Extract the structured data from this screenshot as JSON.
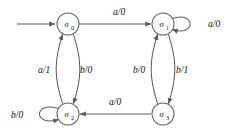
{
  "diagram": {
    "type": "finite-state-machine",
    "stroke_color": "#5e5e5e",
    "label_color": "#111111",
    "background": "#ffffff",
    "states": [
      {
        "id": "s0",
        "label": "σ",
        "subscript": "0",
        "cx": 68,
        "cy": 24,
        "r": 11,
        "initial": true
      },
      {
        "id": "s1",
        "label": "σ",
        "subscript": "1",
        "cx": 163,
        "cy": 24,
        "r": 11,
        "initial": false
      },
      {
        "id": "s2",
        "label": "σ",
        "subscript": "2",
        "cx": 68,
        "cy": 114,
        "r": 11,
        "initial": false
      },
      {
        "id": "s3",
        "label": "σ",
        "subscript": "3",
        "cx": 163,
        "cy": 114,
        "r": 11,
        "initial": false
      }
    ],
    "transitions": [
      {
        "from": "s0",
        "to": "s1",
        "input": "a",
        "output": "0",
        "label": "a/0",
        "label_x": 113,
        "label_y": 15
      },
      {
        "from": "s1",
        "to": "s1",
        "input": "a",
        "output": "0",
        "label": "a/0",
        "label_x": 208,
        "label_y": 27,
        "self_loop": true
      },
      {
        "from": "s0",
        "to": "s2",
        "input": "b",
        "output": "0",
        "label": "b/0",
        "label_x": 80,
        "label_y": 73
      },
      {
        "from": "s2",
        "to": "s0",
        "input": "a",
        "output": "1",
        "label": "a/1",
        "label_x": 38,
        "label_y": 73
      },
      {
        "from": "s1",
        "to": "s3",
        "input": "b",
        "output": "1",
        "label": "b/1",
        "label_x": 176,
        "label_y": 73
      },
      {
        "from": "s3",
        "to": "s1",
        "input": "b",
        "output": "0",
        "label": "b/0",
        "label_x": 133,
        "label_y": 73
      },
      {
        "from": "s3",
        "to": "s2",
        "input": "a",
        "output": "0",
        "label": "a/0",
        "label_x": 109,
        "label_y": 105
      },
      {
        "from": "s2",
        "to": "s2",
        "input": "b",
        "output": "0",
        "label": "b/0",
        "label_x": 11,
        "label_y": 118,
        "self_loop": true
      }
    ],
    "start_arrow": {
      "from_x": 17,
      "to_x": 55,
      "y": 24
    }
  }
}
